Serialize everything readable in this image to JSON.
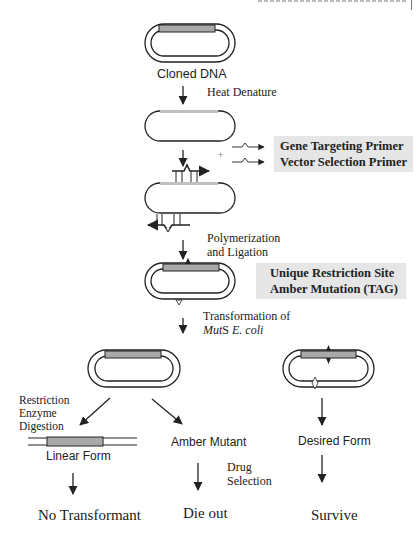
{
  "colors": {
    "insert_fill": "#a9a9a9",
    "insert_light": "#c0c0c0",
    "callout_bg": "#e6e6e6",
    "line": "#222222"
  },
  "steps": {
    "cloned_dna": "Cloned DNA",
    "heat_denature": "Heat Denature",
    "primers_plus": "+",
    "primer_1": "Gene Targeting Primer",
    "primer_2": "Vector Selection Primer",
    "polymerization_1": "Polymerization",
    "polymerization_2": "and Ligation",
    "mutation_1": "Unique Restriction Site",
    "mutation_2": "Amber Mutation (TAG)",
    "transformation_1": "Transformation of",
    "transformation_2_italic_a": "Mut",
    "transformation_2_normal": "S ",
    "transformation_2_italic_b": "E. coli"
  },
  "branches": {
    "left": {
      "label_1": "Restriction",
      "label_2": "Enzyme",
      "label_3": "Digestion",
      "form": "Linear Form",
      "outcome": "No Transformant"
    },
    "middle": {
      "form": "Amber Mutant",
      "label_1": "Drug",
      "label_2": "Selection",
      "outcome": "Die out"
    },
    "right": {
      "form": "Desired Form",
      "outcome": "Survive"
    }
  }
}
